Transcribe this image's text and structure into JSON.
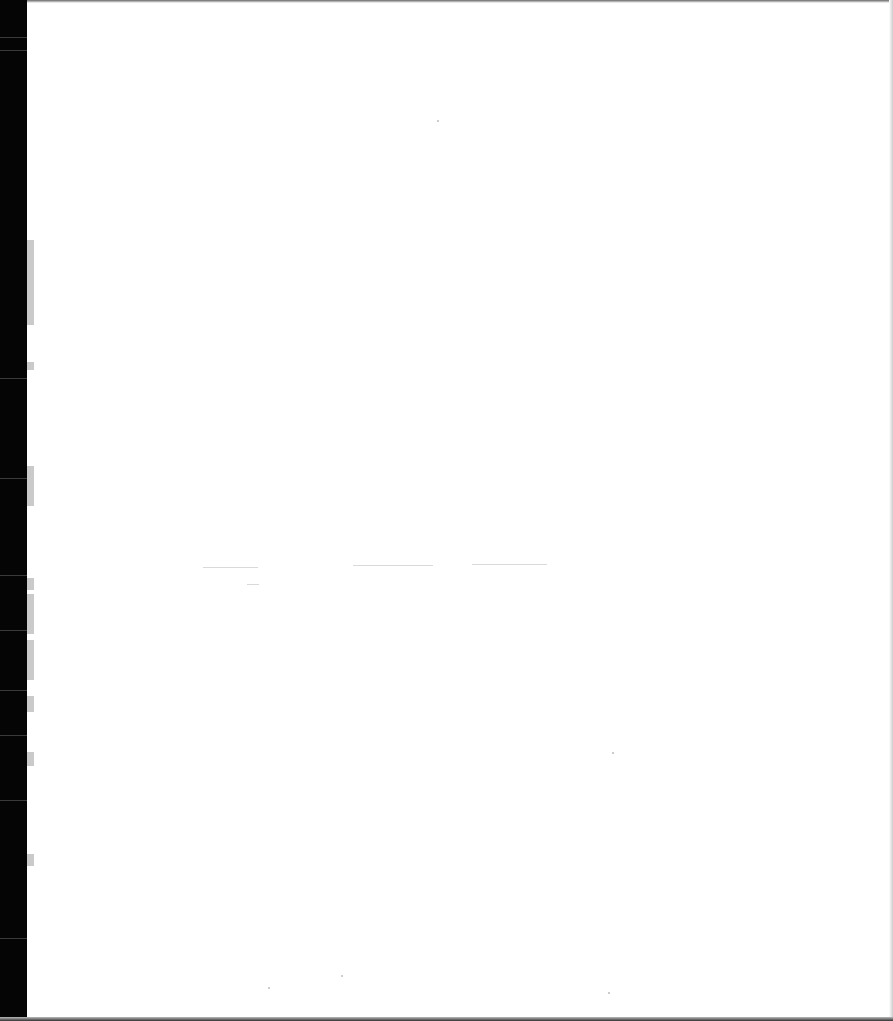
{
  "page": {
    "type": "blank scanned page",
    "text": ""
  },
  "left_tabs": [
    {
      "top": 240,
      "height": 85
    },
    {
      "top": 362,
      "height": 8
    },
    {
      "top": 466,
      "height": 40
    },
    {
      "top": 578,
      "height": 12
    },
    {
      "top": 594,
      "height": 40
    },
    {
      "top": 640,
      "height": 40
    },
    {
      "top": 696,
      "height": 16
    },
    {
      "top": 752,
      "height": 14
    },
    {
      "top": 854,
      "height": 12
    }
  ],
  "faint_lines": [
    {
      "left": 203,
      "top": 567,
      "width": 55
    },
    {
      "left": 353,
      "top": 565,
      "width": 80
    },
    {
      "left": 472,
      "top": 564,
      "width": 75
    },
    {
      "left": 247,
      "top": 584,
      "width": 12
    }
  ]
}
